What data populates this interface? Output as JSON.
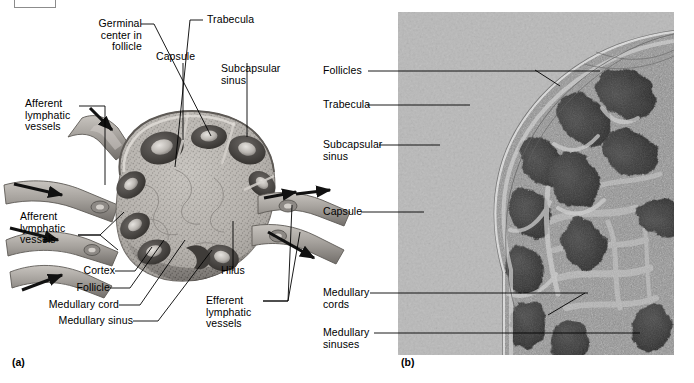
{
  "figure": {
    "panels": [
      {
        "tag": "(a)",
        "type": "illustration",
        "subject": "lymph node sectional diagram"
      },
      {
        "tag": "(b)",
        "type": "photomicrograph",
        "subject": "lymph node histology"
      }
    ]
  },
  "panel_a": {
    "tag": "(a)",
    "labels": [
      {
        "id": "germinal-center",
        "text": "Germinal\ncenter in\nfollicle"
      },
      {
        "id": "capsule",
        "text": "Capsule"
      },
      {
        "id": "trabecula",
        "text": "Trabecula"
      },
      {
        "id": "subcapsular-sinus",
        "text": "Subcapsular\nsinus"
      },
      {
        "id": "afferent-upper",
        "text": "Afferent\nlymphatic\nvessels"
      },
      {
        "id": "afferent-lower",
        "text": "Afferent\nlymphatic\nvessels"
      },
      {
        "id": "cortex",
        "text": "Cortex"
      },
      {
        "id": "follicle",
        "text": "Follicle"
      },
      {
        "id": "medullary-cord",
        "text": "Medullary cord"
      },
      {
        "id": "medullary-sinus",
        "text": "Medullary sinus"
      },
      {
        "id": "hilus",
        "text": "Hilus"
      },
      {
        "id": "efferent",
        "text": "Efferent\nlymphatic\nvessels"
      }
    ]
  },
  "panel_b": {
    "tag": "(b)",
    "labels": [
      {
        "id": "follicles",
        "text": "Follicles"
      },
      {
        "id": "trabecula",
        "text": "Trabecula"
      },
      {
        "id": "subcapsular-sinus",
        "text": "Subcapsular\nsinus"
      },
      {
        "id": "capsule",
        "text": "Capsule"
      },
      {
        "id": "medullary-cords",
        "text": "Medullary\ncords"
      },
      {
        "id": "medullary-sinuses",
        "text": "Medullary\nsinuses"
      }
    ]
  },
  "colors": {
    "text": "#000000",
    "leader_line": "#1a1a1a",
    "photo_background": "#b8b8b8",
    "tissue_dark": "#4a4a4a",
    "tissue_mid": "#8a8a8a",
    "tissue_light": "#c9c9c9",
    "node_fill": "#b5b2ad",
    "node_edge": "#8f8a85",
    "vessel_fill": "#a9a5a0",
    "corner_box_border": "#8c8c8c"
  }
}
